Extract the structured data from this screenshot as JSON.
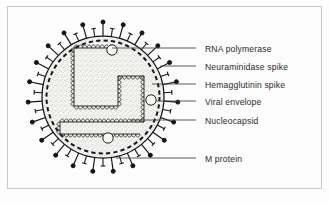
{
  "figure": {
    "frame": {
      "border_color": "#c9c9c9",
      "background": "#fcfcfc"
    }
  },
  "colors": {
    "ink": "#1d1d1d",
    "stipple": "#6e6e6e",
    "envelope": "#111111",
    "leader": "#4a4a4a",
    "text": "#2b2b2b",
    "interior_fill": "#f2f2f0"
  },
  "virion": {
    "center_x": 103,
    "center_y": 97,
    "envelope_radius": 62,
    "matrix_radius": 56,
    "spike_count": 46,
    "spike_types": [
      "hemagglutinin",
      "neuraminidase"
    ],
    "hemagglutinin_length": 14,
    "neuraminidase_length": 8,
    "nucleocapsid_shape": "folded helical ribbon",
    "rna_polymerase_count": 3
  },
  "labels": [
    {
      "id": "rna-polymerase",
      "text": "RNA polymerase",
      "x": 205,
      "y": 44,
      "leader_from_x": 196,
      "leader_from_y": 48,
      "leader_to_x": 112,
      "leader_to_y": 48
    },
    {
      "id": "neuraminidase",
      "text": "Neuraminidase spike",
      "x": 205,
      "y": 62,
      "leader_from_x": 196,
      "leader_from_y": 66,
      "leader_to_x": 160,
      "leader_to_y": 66
    },
    {
      "id": "hemagglutinin",
      "text": "Hemagglutinin spike",
      "x": 205,
      "y": 80,
      "leader_from_x": 196,
      "leader_from_y": 84,
      "leader_to_x": 152,
      "leader_to_y": 84
    },
    {
      "id": "viral-envelope",
      "text": "Viral envelope",
      "x": 205,
      "y": 97,
      "leader_from_x": 196,
      "leader_from_y": 101,
      "leader_to_x": 157,
      "leader_to_y": 101
    },
    {
      "id": "nucleocapsid",
      "text": "Nucleocapsid",
      "x": 205,
      "y": 116,
      "leader_from_x": 196,
      "leader_from_y": 120,
      "leader_to_x": 130,
      "leader_to_y": 120
    },
    {
      "id": "m-protein",
      "text": "M protein",
      "x": 205,
      "y": 154,
      "leader_from_x": 196,
      "leader_from_y": 158,
      "leader_to_x": 116,
      "leader_to_y": 158
    }
  ]
}
